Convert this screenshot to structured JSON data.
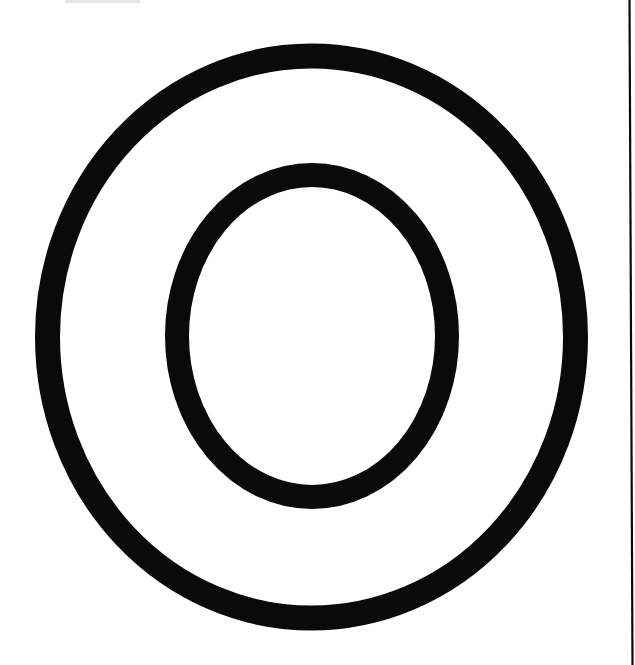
{
  "figure": {
    "letter": "O",
    "background_color": "#ffffff",
    "stroke_color": "#0a0a0a",
    "artifact_color": "#e6e6e6",
    "outer_ring": {
      "cx": 311.5,
      "cy": 337,
      "rx": 264,
      "ry": 281,
      "stroke_width": 25
    },
    "inner_ring": {
      "cx": 312,
      "cy": 336,
      "rx": 135,
      "ry": 161,
      "stroke_width": 24
    },
    "edge_line": {
      "x1": 629.5,
      "y1": 0,
      "x2": 632.5,
      "y2": 665,
      "stroke_width": 2.2
    },
    "top_smudge": {
      "x": 65,
      "y": 0,
      "width": 75,
      "height": 3
    }
  }
}
